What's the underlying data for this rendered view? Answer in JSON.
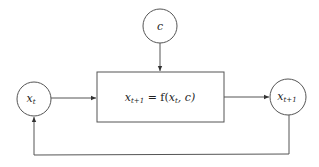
{
  "diagram": {
    "type": "feedback-loop",
    "nodes": {
      "c": {
        "label": "c",
        "shape": "circle"
      },
      "xt": {
        "label": "x",
        "subscript": "t",
        "shape": "circle"
      },
      "xt1": {
        "label": "x",
        "subscript": "t+1",
        "shape": "circle"
      },
      "box": {
        "lhs": "x",
        "lhs_sub": "t+1",
        "eq": " = f(",
        "arg1": "x",
        "arg1_sub": "t",
        "rest": ", c)",
        "shape": "rectangle"
      }
    },
    "edges": [
      {
        "from": "c",
        "to": "box"
      },
      {
        "from": "xt",
        "to": "box"
      },
      {
        "from": "box",
        "to": "xt1"
      },
      {
        "from": "xt1",
        "to": "xt",
        "style": "feedback"
      }
    ],
    "colors": {
      "line": "#555555",
      "text": "#222222",
      "background": "#ffffff"
    }
  }
}
